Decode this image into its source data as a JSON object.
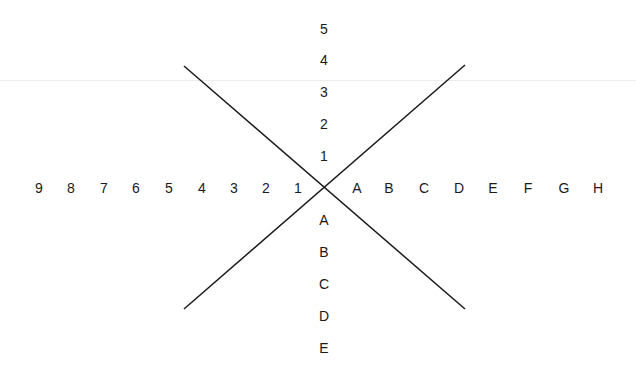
{
  "diagram": {
    "center": {
      "x": 324,
      "y": 187
    },
    "line_color": "#1a1a1a",
    "lines": [
      {
        "name": "diagonal-line-descending",
        "x1": 184,
        "y1": 66,
        "x2": 465,
        "y2": 309
      },
      {
        "name": "diagonal-line-ascending",
        "x1": 184,
        "y1": 309,
        "x2": 465,
        "y2": 65
      }
    ],
    "left_labels": [
      {
        "text": "9",
        "x": 39,
        "y": 188
      },
      {
        "text": "8",
        "x": 71,
        "y": 188
      },
      {
        "text": "7",
        "x": 104,
        "y": 188
      },
      {
        "text": "6",
        "x": 136,
        "y": 188
      },
      {
        "text": "5",
        "x": 169,
        "y": 188
      },
      {
        "text": "4",
        "x": 202,
        "y": 188
      },
      {
        "text": "3",
        "x": 234,
        "y": 188
      },
      {
        "text": "2",
        "x": 266,
        "y": 188
      },
      {
        "text": "1",
        "x": 298,
        "y": 188
      }
    ],
    "right_labels": [
      {
        "text": "A",
        "x": 357,
        "y": 188
      },
      {
        "text": "B",
        "x": 389,
        "y": 188
      },
      {
        "text": "C",
        "x": 424,
        "y": 188
      },
      {
        "text": "D",
        "x": 459,
        "y": 188
      },
      {
        "text": "E",
        "x": 493,
        "y": 188
      },
      {
        "text": "F",
        "x": 528,
        "y": 188
      },
      {
        "text": "G",
        "x": 564,
        "y": 188
      },
      {
        "text": "H",
        "x": 598,
        "y": 188
      }
    ],
    "top_labels": [
      {
        "text": "5",
        "x": 324,
        "y": 29
      },
      {
        "text": "4",
        "x": 324,
        "y": 60
      },
      {
        "text": "3",
        "x": 324,
        "y": 92
      },
      {
        "text": "2",
        "x": 324,
        "y": 124
      },
      {
        "text": "1",
        "x": 324,
        "y": 156
      }
    ],
    "bottom_labels": [
      {
        "text": "A",
        "x": 324,
        "y": 220
      },
      {
        "text": "B",
        "x": 324,
        "y": 252
      },
      {
        "text": "C",
        "x": 324,
        "y": 284
      },
      {
        "text": "D",
        "x": 324,
        "y": 316
      },
      {
        "text": "E",
        "x": 324,
        "y": 348
      }
    ]
  }
}
